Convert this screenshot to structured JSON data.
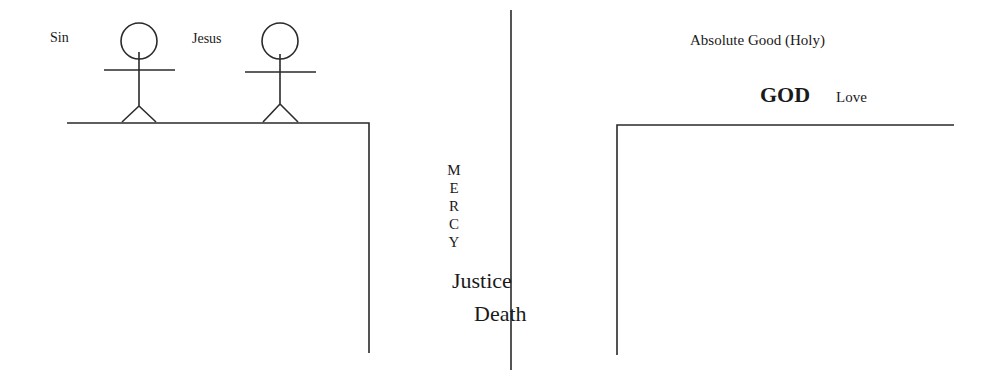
{
  "labels": {
    "sin": "Sin",
    "jesus": "Jesus",
    "absolute_good": "Absolute Good (Holy)",
    "god": "GOD",
    "love": "Love",
    "mercy_letters": [
      "M",
      "E",
      "R",
      "C",
      "Y"
    ],
    "justice": "Justice",
    "death": "Death"
  },
  "colors": {
    "line": "#2a2a2a",
    "text": "#1a1a1a",
    "background": "#ffffff"
  }
}
